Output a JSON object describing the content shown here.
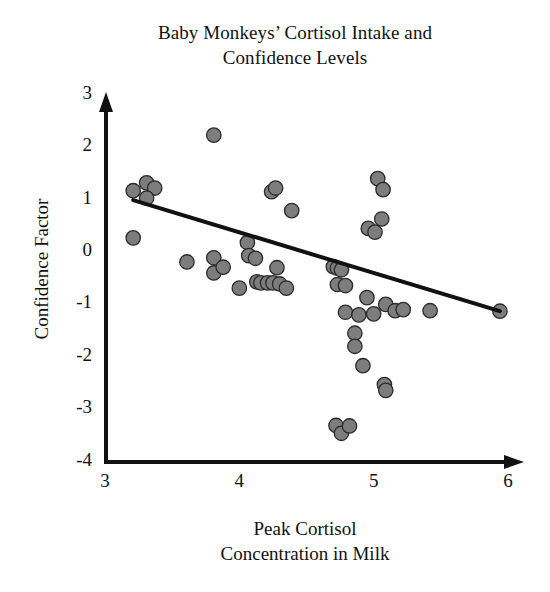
{
  "chart_data": {
    "type": "scatter",
    "title": "Baby Monkeys’ Cortisol Intake and Confidence Levels",
    "title_line1": "Baby Monkeys’ Cortisol Intake and",
    "title_line2": "Confidence Levels",
    "xlabel": "Peak Cortisol Concentration in Milk",
    "xlabel_line1": "Peak Cortisol",
    "xlabel_line2": "Concentration in Milk",
    "ylabel": "Confidence Factor",
    "xlim": [
      3,
      6
    ],
    "ylim": [
      -4,
      3
    ],
    "xticks": [
      "3",
      "4",
      "5",
      "6"
    ],
    "xtick_values": [
      3,
      4,
      5,
      6
    ],
    "yticks": [
      "3",
      "2",
      "1",
      "0",
      "-1",
      "-2",
      "-3",
      "-4"
    ],
    "ytick_values": [
      3,
      2,
      1,
      0,
      -1,
      -2,
      -3,
      -4
    ],
    "grid": false,
    "legend": false,
    "marker_color": "#7d7d7d",
    "marker_edge_color": "#2a2a2a",
    "axis_color": "#111111",
    "trendline_color": "#111111",
    "trendline": {
      "x": [
        3.21,
        5.94
      ],
      "y": [
        0.99,
        -1.13
      ],
      "slope": -0.78,
      "intercept": 3.49
    },
    "points": [
      {
        "x": 3.21,
        "y": 1.17
      },
      {
        "x": 3.31,
        "y": 1.32
      },
      {
        "x": 3.37,
        "y": 1.22
      },
      {
        "x": 3.31,
        "y": 1.03
      },
      {
        "x": 3.21,
        "y": 0.27
      },
      {
        "x": 3.61,
        "y": -0.19
      },
      {
        "x": 3.81,
        "y": 2.23
      },
      {
        "x": 3.81,
        "y": -0.11
      },
      {
        "x": 3.81,
        "y": -0.4
      },
      {
        "x": 3.88,
        "y": -0.29
      },
      {
        "x": 4.0,
        "y": -0.69
      },
      {
        "x": 4.06,
        "y": 0.18
      },
      {
        "x": 4.07,
        "y": -0.07
      },
      {
        "x": 4.12,
        "y": -0.12
      },
      {
        "x": 4.13,
        "y": -0.57
      },
      {
        "x": 4.16,
        "y": -0.59
      },
      {
        "x": 4.21,
        "y": -0.59
      },
      {
        "x": 4.24,
        "y": 1.15
      },
      {
        "x": 4.27,
        "y": 1.22
      },
      {
        "x": 4.25,
        "y": -0.59
      },
      {
        "x": 4.28,
        "y": -0.3
      },
      {
        "x": 4.3,
        "y": -0.61
      },
      {
        "x": 4.35,
        "y": -0.69
      },
      {
        "x": 4.39,
        "y": 0.79
      },
      {
        "x": 4.7,
        "y": -0.28
      },
      {
        "x": 4.73,
        "y": -0.31
      },
      {
        "x": 4.76,
        "y": -0.34
      },
      {
        "x": 4.73,
        "y": -0.62
      },
      {
        "x": 4.79,
        "y": -0.64
      },
      {
        "x": 4.79,
        "y": -1.15
      },
      {
        "x": 4.72,
        "y": -3.31
      },
      {
        "x": 4.76,
        "y": -3.46
      },
      {
        "x": 4.82,
        "y": -3.32
      },
      {
        "x": 4.86,
        "y": -1.55
      },
      {
        "x": 4.86,
        "y": -1.8
      },
      {
        "x": 4.89,
        "y": -1.2
      },
      {
        "x": 4.92,
        "y": -2.17
      },
      {
        "x": 4.95,
        "y": -0.87
      },
      {
        "x": 4.96,
        "y": 0.45
      },
      {
        "x": 5.0,
        "y": -1.18
      },
      {
        "x": 5.01,
        "y": 0.38
      },
      {
        "x": 5.03,
        "y": 1.4
      },
      {
        "x": 5.06,
        "y": 0.63
      },
      {
        "x": 5.07,
        "y": 1.19
      },
      {
        "x": 5.08,
        "y": -2.53
      },
      {
        "x": 5.09,
        "y": -2.64
      },
      {
        "x": 5.09,
        "y": -1.0
      },
      {
        "x": 5.16,
        "y": -1.12
      },
      {
        "x": 5.22,
        "y": -1.1
      },
      {
        "x": 5.42,
        "y": -1.12
      },
      {
        "x": 5.94,
        "y": -1.13
      }
    ]
  }
}
